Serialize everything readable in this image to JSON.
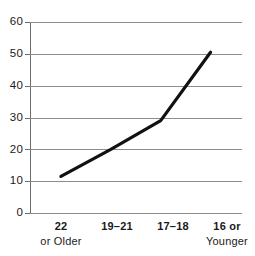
{
  "chart_data": {
    "type": "line",
    "title": "",
    "subtitle": "",
    "xlabel": "",
    "ylabel": "",
    "categories": [
      "22 or Older",
      "19–21",
      "17–18",
      "16 or Younger"
    ],
    "x_tick_lines": [
      {
        "line1": "22",
        "line2": "or Older"
      },
      {
        "line1": "19–21",
        "line2": ""
      },
      {
        "line1": "17–18",
        "line2": ""
      },
      {
        "line1": "16 or",
        "line2": "Younger"
      }
    ],
    "series": [
      {
        "name": "",
        "values": [
          11.5,
          20,
          29,
          50.5
        ]
      }
    ],
    "ylim": [
      0,
      60
    ],
    "y_ticks": [
      0,
      10,
      20,
      30,
      40,
      50,
      60
    ],
    "y_tick_labels": [
      "0",
      "10",
      "20",
      "30",
      "40",
      "50",
      "60"
    ],
    "grid": "horizontal",
    "legend": "none",
    "line_color": "#111111",
    "grid_color": "#8c8c8c",
    "axis_color": "#6b6b6b",
    "background_color": "#ffffff"
  }
}
